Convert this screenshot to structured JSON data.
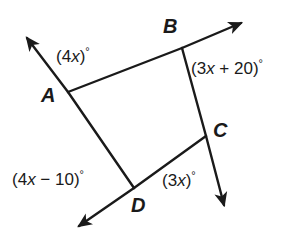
{
  "figure": {
    "type": "geometry-diagram",
    "shape": "quadrilateral",
    "stroke_color": "#1a1a1a",
    "background_color": "#ffffff"
  },
  "vertices": [
    {
      "id": "A",
      "label": "A",
      "x": 68,
      "y": 92
    },
    {
      "id": "B",
      "label": "B",
      "x": 182,
      "y": 48
    },
    {
      "id": "C",
      "label": "C",
      "x": 206,
      "y": 136
    },
    {
      "id": "D",
      "label": "D",
      "x": 134,
      "y": 188
    }
  ],
  "sides": [
    {
      "from": "A",
      "to": "B"
    },
    {
      "from": "B",
      "to": "C"
    },
    {
      "from": "C",
      "to": "D"
    },
    {
      "from": "D",
      "to": "A"
    }
  ],
  "rays": [
    {
      "id": "ray-past-A",
      "from": "D",
      "through": "A",
      "tip_x": 26,
      "tip_y": 37,
      "arrowhead": true
    },
    {
      "id": "ray-past-B",
      "from": "A",
      "through": "B",
      "tip_x": 243,
      "tip_y": 22,
      "arrowhead": true
    },
    {
      "id": "ray-past-C",
      "from": "B",
      "through": "C",
      "tip_x": 226,
      "tip_y": 208,
      "arrowhead": true
    },
    {
      "id": "ray-past-D",
      "from": "C",
      "through": "D",
      "tip_x": 76,
      "tip_y": 228,
      "arrowhead": true
    }
  ],
  "angle_labels": {
    "at_A": {
      "open": "(",
      "coefficient": "4",
      "variable": "x",
      "close": ")",
      "degree": "°",
      "full_text": "(4x)°"
    },
    "at_B": {
      "open": "(",
      "coefficient": "3",
      "variable": "x",
      "operator": " + ",
      "constant": "20",
      "close": ")",
      "degree": "°",
      "full_text": "(3x + 20)°"
    },
    "at_C": {
      "open": "(",
      "coefficient": "3",
      "variable": "x",
      "close": ")",
      "degree": "°",
      "full_text": "(3x)°"
    },
    "at_D": {
      "open": "(",
      "coefficient": "4",
      "variable": "x",
      "operator": " − ",
      "constant": "10",
      "close": ")",
      "degree": "°",
      "full_text": "(4x − 10)°"
    }
  }
}
